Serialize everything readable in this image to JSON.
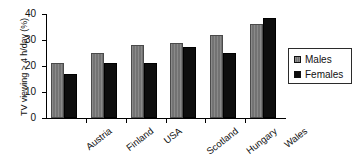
{
  "chart_data": {
    "type": "bar",
    "title": "",
    "subtitle": "",
    "xlabel": "",
    "ylabel": "TV viewing > 4 h/day (%)",
    "categories": [
      "Austria",
      "Finland",
      "USA",
      "Scotland",
      "Hungary",
      "Wales"
    ],
    "series": [
      {
        "name": "Males",
        "color": "#737373",
        "values": [
          21,
          25,
          28,
          29,
          32,
          36
        ]
      },
      {
        "name": "Females",
        "color": "#0d0d0d",
        "values": [
          17,
          21,
          21,
          27.5,
          25,
          38.5
        ]
      }
    ],
    "ylim": [
      0,
      40
    ],
    "yticks": [
      0,
      10,
      20,
      30,
      40
    ],
    "ytick_labels": [
      "0",
      "10",
      "20",
      "30",
      "40"
    ],
    "grid": false,
    "legend_position": "right",
    "legend_entries": [
      "Males",
      "Females"
    ]
  }
}
